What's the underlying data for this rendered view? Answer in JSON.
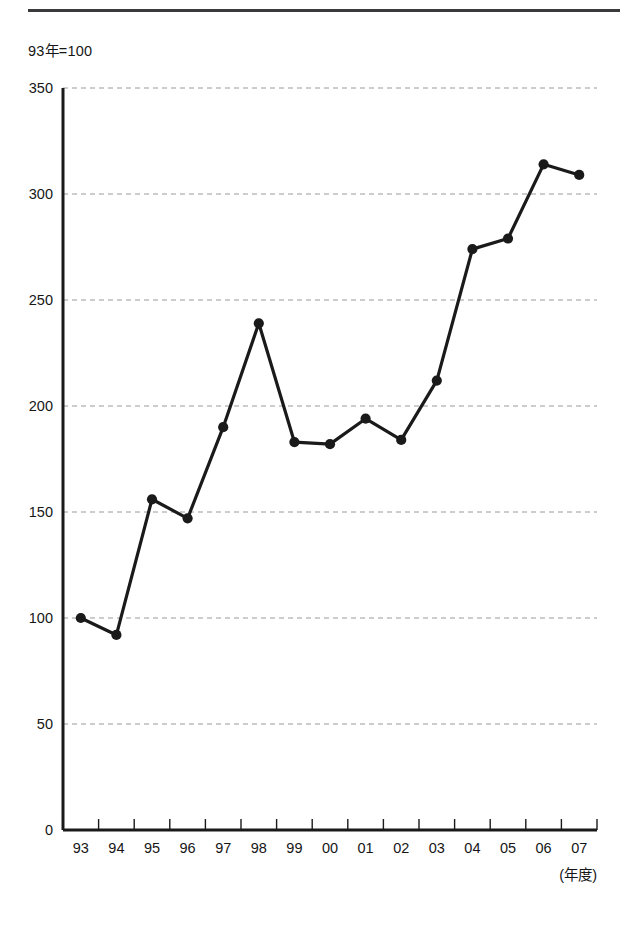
{
  "page": {
    "background_color": "#ffffff",
    "rule_color": "#3a3a3c"
  },
  "unit_note": "93年=100",
  "axis_caption": "(年度)",
  "chart_data": {
    "type": "line",
    "title": "",
    "subtitle": "",
    "unit_note": "93年=100",
    "xlabel": "(年度)",
    "ylabel": "",
    "categories": [
      "93",
      "94",
      "95",
      "96",
      "97",
      "98",
      "99",
      "00",
      "01",
      "02",
      "03",
      "04",
      "05",
      "06",
      "07"
    ],
    "values": [
      100,
      92,
      156,
      147,
      190,
      239,
      183,
      182,
      194,
      184,
      212,
      274,
      279,
      314,
      309
    ],
    "series": [
      {
        "name": "index",
        "values": [
          100,
          92,
          156,
          147,
          190,
          239,
          183,
          182,
          194,
          184,
          212,
          274,
          279,
          314,
          309
        ]
      }
    ],
    "ylim": [
      0,
      350
    ],
    "yticks": [
      0,
      50,
      100,
      150,
      200,
      250,
      300,
      350
    ],
    "ytick_labels": [
      "0",
      "50",
      "100",
      "150",
      "200",
      "250",
      "300",
      "350"
    ],
    "grid": true,
    "grid_style": "dashed-horizontal",
    "grid_color": "#9a9a9a",
    "legend": false,
    "legend_position": "none",
    "line_color": "#1a1a1a",
    "line_width": 3.2,
    "marker": "circle",
    "marker_size": 7,
    "marker_color": "#1a1a1a"
  }
}
